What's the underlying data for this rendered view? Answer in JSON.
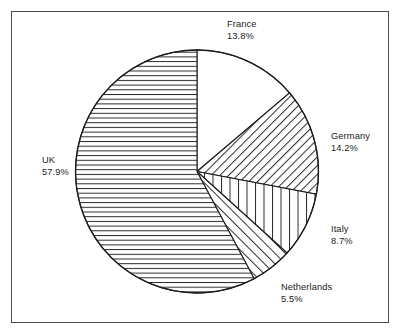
{
  "chart_data": {
    "type": "pie",
    "title": "",
    "categories": [
      "France",
      "Germany",
      "Italy",
      "Netherlands",
      "UK"
    ],
    "values": [
      13.8,
      14.2,
      8.7,
      5.5,
      57.9
    ],
    "value_unit": "%",
    "legend": "none",
    "labels_position": "outside",
    "start_angle_deg": 0,
    "direction": "clockwise",
    "slices": [
      {
        "name": "France",
        "value": 13.8,
        "value_text": "13.8%",
        "fill": "blank",
        "start_deg": 0.0,
        "end_deg": 49.68
      },
      {
        "name": "Germany",
        "value": 14.2,
        "value_text": "14.2%",
        "fill": "diagonal-backslash",
        "start_deg": 49.68,
        "end_deg": 100.8
      },
      {
        "name": "Italy",
        "value": 8.7,
        "value_text": "8.7%",
        "fill": "vertical",
        "start_deg": 100.8,
        "end_deg": 132.12
      },
      {
        "name": "Netherlands",
        "value": 5.5,
        "value_text": "5.5%",
        "fill": "diagonal-slash",
        "start_deg": 132.12,
        "end_deg": 151.92
      },
      {
        "name": "UK",
        "value": 57.9,
        "value_text": "57.9%",
        "fill": "horizontal",
        "start_deg": 151.92,
        "end_deg": 360.0
      }
    ],
    "colors": {
      "stroke": "#1c1c1c",
      "background": "#ffffff",
      "frame": "#4a4a4a"
    }
  },
  "labels": {
    "france": {
      "name": "France",
      "pct": "13.8%"
    },
    "germany": {
      "name": "Germany",
      "pct": "14.2%"
    },
    "italy": {
      "name": "Italy",
      "pct": "8.7%"
    },
    "netherlands": {
      "name": "Netherlands",
      "pct": "5.5%"
    },
    "uk": {
      "name": "UK",
      "pct": "57.9%"
    }
  }
}
